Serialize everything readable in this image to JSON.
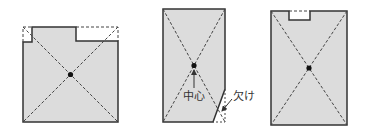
{
  "diagram": {
    "title": "",
    "colors": {
      "fill": "#dcdcdc",
      "outline": "#333333",
      "dashed": "#444444",
      "center_dot": "#111111",
      "text": "#333333"
    },
    "figures": [
      {
        "id": "figure-1",
        "description": "Square floor plan with missing top-left corner and top-right notch; dashed lines complete the bounding square; diagonals cross at center"
      },
      {
        "id": "figure-2",
        "description": "Tall rectangle with a cut (chipped) bottom-right corner; diagonals cross at center",
        "labels": {
          "center": "中心",
          "chip": "欠け"
        }
      },
      {
        "id": "figure-3",
        "description": "Tall rectangle with a small rectangular notch at the top edge; diagonals cross at center"
      }
    ]
  }
}
